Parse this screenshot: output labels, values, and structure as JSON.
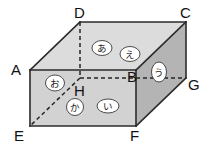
{
  "figure": {
    "type": "cuboid-oblique-projection",
    "colors": {
      "background": "#ffffff",
      "face_top": "#dcdcdc",
      "face_front": "#d2d2d2",
      "face_right": "#b4b4b4",
      "face_left": "#c8c8c8",
      "edge_solid": "#2b2b2b",
      "edge_hidden": "#262626",
      "bubble_fill": "#ffffff",
      "bubble_stroke": "#3a3a3a",
      "label_text": "#111111"
    },
    "vertices": [
      {
        "id": "A",
        "label": "A",
        "x": 30,
        "y": 70,
        "hidden": false,
        "text_x": 11,
        "text_y": 75
      },
      {
        "id": "B",
        "label": "B",
        "x": 136,
        "y": 70,
        "hidden": false,
        "text_x": 127,
        "text_y": 82
      },
      {
        "id": "C",
        "label": "C",
        "x": 186,
        "y": 22,
        "hidden": false,
        "text_x": 180,
        "text_y": 18
      },
      {
        "id": "D",
        "label": "D",
        "x": 80,
        "y": 22,
        "hidden": false,
        "text_x": 74,
        "text_y": 18
      },
      {
        "id": "E",
        "label": "E",
        "x": 30,
        "y": 126,
        "hidden": false,
        "text_x": 14,
        "text_y": 141
      },
      {
        "id": "F",
        "label": "F",
        "x": 136,
        "y": 126,
        "hidden": false,
        "text_x": 130,
        "text_y": 141
      },
      {
        "id": "G",
        "label": "G",
        "x": 186,
        "y": 78,
        "hidden": false,
        "text_x": 188,
        "text_y": 90
      },
      {
        "id": "H",
        "label": "H",
        "x": 80,
        "y": 78,
        "hidden": true,
        "text_x": 74,
        "text_y": 96
      }
    ],
    "faces": [
      {
        "id": "top",
        "name": "face-top",
        "points": "30,70 80,22 186,22 136,70",
        "fill": "#dcdcdc"
      },
      {
        "id": "front",
        "name": "face-front",
        "points": "30,70 136,70 136,126 30,126",
        "fill": "#d2d2d2"
      },
      {
        "id": "right",
        "name": "face-right",
        "points": "136,70 186,22 186,78 136,126",
        "fill": "#b4b4b4"
      }
    ],
    "solid_edges": [
      {
        "name": "edge-A-D",
        "x1": 30,
        "y1": 70,
        "x2": 80,
        "y2": 22
      },
      {
        "name": "edge-D-C",
        "x1": 80,
        "y1": 22,
        "x2": 186,
        "y2": 22
      },
      {
        "name": "edge-C-B",
        "x1": 186,
        "y1": 22,
        "x2": 136,
        "y2": 70
      },
      {
        "name": "edge-B-A",
        "x1": 136,
        "y1": 70,
        "x2": 30,
        "y2": 70
      },
      {
        "name": "edge-A-E",
        "x1": 30,
        "y1": 70,
        "x2": 30,
        "y2": 126
      },
      {
        "name": "edge-B-F",
        "x1": 136,
        "y1": 70,
        "x2": 136,
        "y2": 126
      },
      {
        "name": "edge-C-G",
        "x1": 186,
        "y1": 22,
        "x2": 186,
        "y2": 78
      },
      {
        "name": "edge-E-F",
        "x1": 30,
        "y1": 126,
        "x2": 136,
        "y2": 126
      },
      {
        "name": "edge-F-G",
        "x1": 136,
        "y1": 126,
        "x2": 186,
        "y2": 78
      }
    ],
    "hidden_edges": [
      {
        "name": "edge-D-H",
        "x1": 80,
        "y1": 22,
        "x2": 80,
        "y2": 78
      },
      {
        "name": "edge-H-G",
        "x1": 80,
        "y1": 78,
        "x2": 186,
        "y2": 78
      },
      {
        "name": "edge-H-E",
        "x1": 80,
        "y1": 78,
        "x2": 30,
        "y2": 126
      }
    ],
    "kana_markers": [
      {
        "id": "a",
        "label": "あ",
        "romaji": "a",
        "face": "top",
        "cx": 102,
        "cy": 48,
        "rx": 10,
        "ry": 7.5
      },
      {
        "id": "e",
        "label": "え",
        "romaji": "e",
        "face": "top",
        "cx": 130,
        "cy": 54,
        "rx": 10,
        "ry": 7.5
      },
      {
        "id": "u",
        "label": "う",
        "romaji": "u",
        "face": "right",
        "cx": 159,
        "cy": 72,
        "rx": 7.5,
        "ry": 10
      },
      {
        "id": "o",
        "label": "お",
        "romaji": "o",
        "face": "left",
        "cx": 55,
        "cy": 83,
        "rx": 9.5,
        "ry": 8
      },
      {
        "id": "ka",
        "label": "か",
        "romaji": "ka",
        "face": "front",
        "cx": 75,
        "cy": 107,
        "rx": 8.5,
        "ry": 8.5
      },
      {
        "id": "i",
        "label": "い",
        "romaji": "i",
        "face": "front",
        "cx": 108,
        "cy": 106,
        "rx": 11,
        "ry": 7
      }
    ]
  }
}
